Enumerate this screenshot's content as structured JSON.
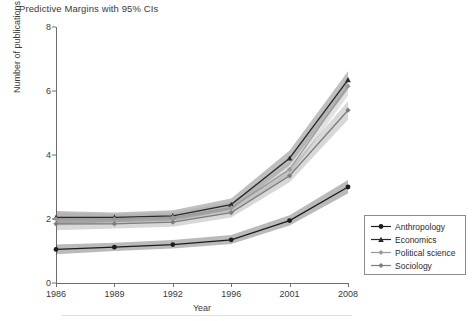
{
  "title": "Predictive Margins with 95% CIs",
  "axis": {
    "ylabel": "Number of publications per scholar per period",
    "xlabel": "Year",
    "yticks": [
      "0",
      "2",
      "4",
      "6",
      "8"
    ],
    "xticks": [
      "1986",
      "1989",
      "1992",
      "1996",
      "2001",
      "2008"
    ]
  },
  "legend": {
    "items": [
      {
        "label": "Anthropology",
        "marker": "circle-marker-icon",
        "color": "#1b1b1b"
      },
      {
        "label": "Economics",
        "marker": "triangle-marker-icon",
        "color": "#2a2a2a"
      },
      {
        "label": "Political science",
        "marker": "diamond-marker-icon",
        "color": "#9a9a9a"
      },
      {
        "label": "Sociology",
        "marker": "diamond-marker-icon",
        "color": "#7d7d7d"
      }
    ]
  },
  "chart_data": {
    "type": "line",
    "title": "Predictive Margins with 95% CIs",
    "xlabel": "Year",
    "ylabel": "Number of publications per scholar per period",
    "x": [
      1986,
      1989,
      1992,
      1996,
      2001,
      2008
    ],
    "xlim": [
      1986,
      2008
    ],
    "ylim": [
      0,
      8
    ],
    "grid": false,
    "legend_position": "bottom-right",
    "annotation": "Bands show 95% confidence intervals",
    "series": [
      {
        "name": "Anthropology",
        "color": "#1b1b1b",
        "marker": "circle",
        "values": [
          1.05,
          1.12,
          1.2,
          1.35,
          1.95,
          3.0
        ],
        "ci_lower": [
          0.9,
          1.0,
          1.08,
          1.22,
          1.8,
          2.8
        ],
        "ci_upper": [
          1.2,
          1.26,
          1.34,
          1.5,
          2.12,
          3.22
        ]
      },
      {
        "name": "Economics",
        "color": "#2a2a2a",
        "marker": "triangle",
        "values": [
          2.05,
          2.05,
          2.1,
          2.45,
          3.9,
          6.35
        ],
        "ci_lower": [
          1.85,
          1.9,
          1.95,
          2.28,
          3.68,
          6.05
        ],
        "ci_upper": [
          2.25,
          2.2,
          2.27,
          2.64,
          4.14,
          6.62
        ]
      },
      {
        "name": "Political science",
        "color": "#9a9a9a",
        "marker": "diamond",
        "values": [
          2.0,
          2.0,
          2.05,
          2.35,
          3.55,
          6.15
        ],
        "ci_lower": [
          1.8,
          1.85,
          1.9,
          2.2,
          3.35,
          5.85
        ],
        "ci_upper": [
          2.2,
          2.16,
          2.2,
          2.52,
          3.78,
          6.44
        ]
      },
      {
        "name": "Sociology",
        "color": "#7d7d7d",
        "marker": "diamond",
        "values": [
          1.85,
          1.85,
          1.9,
          2.2,
          3.35,
          5.4
        ],
        "ci_lower": [
          1.65,
          1.7,
          1.76,
          2.05,
          3.15,
          5.1
        ],
        "ci_upper": [
          2.05,
          2.0,
          2.05,
          2.38,
          3.58,
          5.68
        ]
      }
    ]
  }
}
